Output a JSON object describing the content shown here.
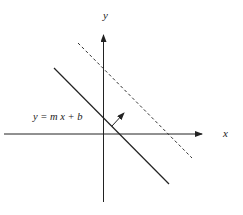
{
  "diagram": {
    "axes": {
      "x_label": "x",
      "y_label": "y"
    },
    "line_label": "y = m x + b",
    "elements": [
      {
        "id": "solid-line",
        "style": "solid",
        "from": [
          54,
          68
        ],
        "to": [
          169,
          184
        ]
      },
      {
        "id": "dashed-line",
        "style": "dashed",
        "from": [
          78,
          43
        ],
        "to": [
          192,
          158
        ]
      },
      {
        "id": "normal-arrow",
        "from": [
          112,
          126
        ],
        "to": [
          124,
          113
        ]
      }
    ],
    "colors": {
      "stroke": "#222222",
      "background": "#ffffff"
    }
  }
}
